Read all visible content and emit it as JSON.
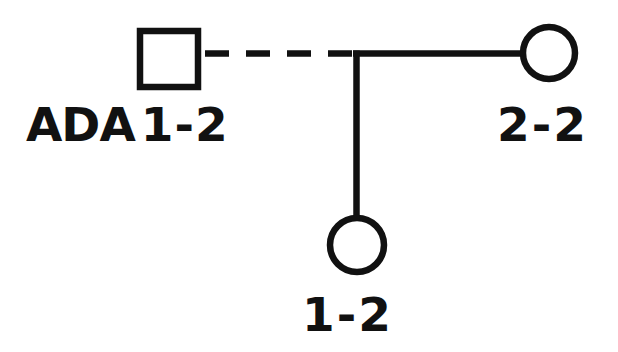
{
  "diagram": {
    "type": "pedigree",
    "stroke_color": "#111111",
    "background_color": "#ffffff",
    "gene_symbol": "ADA",
    "generations": 2,
    "symbols": [
      {
        "id": "father",
        "shape": "square",
        "sex": "male",
        "generation": 1,
        "filled": false,
        "center": [
          169,
          59
        ],
        "size": 64,
        "label": "ADA 1-2",
        "gene": "ADA",
        "genotype": "1-2"
      },
      {
        "id": "mother",
        "shape": "circle",
        "sex": "female",
        "generation": 1,
        "filled": false,
        "center": [
          549,
          53
        ],
        "radius": 29,
        "label": "2-2",
        "genotype": "2-2"
      },
      {
        "id": "child",
        "shape": "circle",
        "sex": "female",
        "generation": 2,
        "filled": false,
        "center": [
          357,
          245
        ],
        "radius": 30,
        "label": "1-2",
        "genotype": "1-2"
      }
    ],
    "connections": [
      {
        "id": "mating-line-dashed",
        "style": "dashed",
        "from": "father",
        "to": "junction",
        "meaning": "non-biological-or-uncertain relationship",
        "dash_count": 4
      },
      {
        "id": "mating-line-solid",
        "style": "solid",
        "from": "junction",
        "to": "mother"
      },
      {
        "id": "descent-line",
        "style": "solid",
        "from": "junction",
        "to": "child"
      }
    ],
    "labels": {
      "father_gene": "ADA",
      "father_genotype": "1-2",
      "mother_genotype": "2-2",
      "child_genotype": "1-2"
    }
  }
}
